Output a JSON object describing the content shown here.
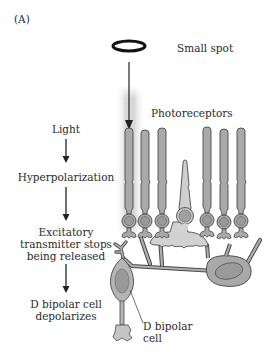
{
  "panel_label": "(A)",
  "stimulus": {
    "label": "Small spot"
  },
  "labels": {
    "photoreceptors": "Photoreceptors",
    "d_bipolar_cell_line1": "D bipolar",
    "d_bipolar_cell_line2": "cell"
  },
  "flow": {
    "steps": [
      {
        "lines": [
          "Light"
        ]
      },
      {
        "lines": [
          "Hyperpolarization"
        ]
      },
      {
        "lines": [
          "Excitatory",
          "transmitter stops",
          "being released"
        ]
      },
      {
        "lines": [
          "D bipolar cell",
          "depolarizes"
        ]
      }
    ]
  },
  "colors": {
    "cell_fill": "#a9a9a9",
    "cell_fill_light": "#c8c8c8",
    "cone_fill": "#d0d0d0",
    "nucleus_fill": "#9a9a9a",
    "outline": "#4a4a4a",
    "highlight_glow": "#d9d9d9",
    "text": "#2a2a2a"
  }
}
